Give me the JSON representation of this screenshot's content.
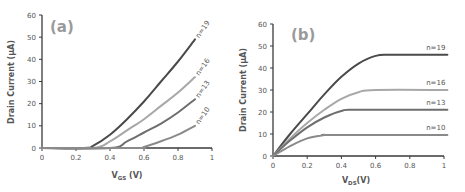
{
  "chart_data": [
    {
      "panel": "(a)",
      "type": "line",
      "title": "",
      "xlabel": "V_GS (V)",
      "xlabel_main": "V",
      "xlabel_sub": "GS",
      "xlabel_unit": " (V)",
      "ylabel": "Drain Current (µA)",
      "xlim": [
        0,
        1
      ],
      "ylim": [
        0,
        60
      ],
      "xticks": [
        "0",
        "0.2",
        "0.4",
        "0.6",
        "0.8",
        "1"
      ],
      "yticks": [
        "0",
        "10",
        "20",
        "30",
        "40",
        "50",
        "60"
      ],
      "grid": false,
      "legend": "inline labels at curve ends",
      "series": [
        {
          "name": "n=19",
          "color": "#4a4a4a",
          "x": [
            0,
            0.25,
            0.3,
            0.4,
            0.5,
            0.6,
            0.7,
            0.8,
            0.9
          ],
          "values": [
            0,
            0,
            1,
            6,
            13,
            21,
            30,
            39,
            49
          ]
        },
        {
          "name": "n=16",
          "color": "#a8a8a8",
          "x": [
            0,
            0.3,
            0.4,
            0.5,
            0.6,
            0.7,
            0.8,
            0.9
          ],
          "values": [
            0,
            0,
            3,
            8,
            13,
            19,
            25,
            32
          ]
        },
        {
          "name": "n=13",
          "color": "#6e6e6e",
          "x": [
            0,
            0.4,
            0.5,
            0.6,
            0.7,
            0.8,
            0.9
          ],
          "values": [
            0,
            0,
            3,
            7,
            11,
            16,
            22
          ]
        },
        {
          "name": "n=10",
          "color": "#8a8a8a",
          "x": [
            0,
            0.55,
            0.6,
            0.7,
            0.8,
            0.9
          ],
          "values": [
            0,
            0,
            0.5,
            3,
            6,
            10
          ]
        }
      ]
    },
    {
      "panel": "(b)",
      "type": "line",
      "title": "",
      "xlabel": "V_DS (V)",
      "xlabel_main": "V",
      "xlabel_sub": "DS",
      "xlabel_unit": "(V)",
      "ylabel": "Drain Current (µA)",
      "xlim": [
        0,
        1
      ],
      "ylim": [
        0,
        60
      ],
      "xticks": [
        "0",
        "0.2",
        "0.4",
        "0.6",
        "0.8",
        "1"
      ],
      "yticks": [
        "0",
        "10",
        "20",
        "30",
        "40",
        "50",
        "60"
      ],
      "grid": false,
      "legend": "inline labels above curve plateaus",
      "series": [
        {
          "name": "n=19",
          "color": "#4a4a4a",
          "x": [
            0,
            0.1,
            0.2,
            0.3,
            0.4,
            0.5,
            0.6,
            0.7,
            1.02
          ],
          "values": [
            0,
            10,
            19,
            28,
            36,
            42,
            45.5,
            46,
            46
          ]
        },
        {
          "name": "n=16",
          "color": "#a8a8a8",
          "x": [
            0,
            0.1,
            0.2,
            0.3,
            0.4,
            0.5,
            0.6,
            1.02
          ],
          "values": [
            0,
            8,
            15,
            21,
            26,
            29,
            30,
            30
          ]
        },
        {
          "name": "n=13",
          "color": "#6e6e6e",
          "x": [
            0,
            0.1,
            0.2,
            0.3,
            0.4,
            0.5,
            1.02
          ],
          "values": [
            0,
            7,
            13,
            17.5,
            20.5,
            21,
            21
          ]
        },
        {
          "name": "n=10",
          "color": "#8a8a8a",
          "x": [
            0,
            0.1,
            0.2,
            0.3,
            0.35,
            1.02
          ],
          "values": [
            0,
            4.5,
            8,
            9.5,
            9.5,
            9.5
          ]
        }
      ]
    }
  ]
}
